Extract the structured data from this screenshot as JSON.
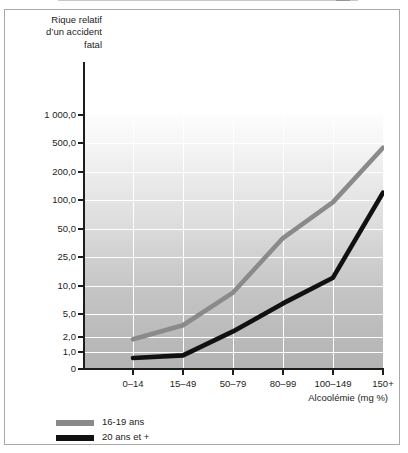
{
  "figure": {
    "background": "#ffffff",
    "border_color": "#a9a9a9"
  },
  "axis_titles": {
    "y_line1": "Rique relatif",
    "y_line2": "d’un accident",
    "y_line3": "fatal",
    "x": "Alcoolémie (mg %)"
  },
  "legend": {
    "items": [
      {
        "label": "16-19 ans",
        "color": "#8a8a8a"
      },
      {
        "label": "20 ans et +",
        "color": "#111111"
      }
    ]
  },
  "chart_data": {
    "type": "line",
    "title": "",
    "subtitle": "",
    "xlabel": "Alcoolémie (mg %)",
    "ylabel": "Rique relatif d’un accident fatal",
    "categories": [
      "0–14",
      "15–49",
      "50–79",
      "80–99",
      "100–149",
      "150+"
    ],
    "y_tick_labels": [
      "1 000,0",
      "500,0",
      "200,0",
      "100,0",
      "50,0",
      "25,0",
      "10,0",
      "5,0",
      "2,0",
      "1,0",
      "0"
    ],
    "y_tick_values": [
      1000,
      500,
      200,
      100,
      50,
      25,
      10,
      5,
      2,
      1,
      0
    ],
    "yscale": "log-like ordinal",
    "grid": true,
    "grid_color": "#ffffff",
    "legend_position": "bottom-left",
    "series": [
      {
        "name": "16-19 ans",
        "color": "#8a8a8a",
        "values": [
          1.8,
          3.2,
          8.5,
          40,
          95,
          430
        ]
      },
      {
        "name": "20 ans et +",
        "color": "#111111",
        "values": [
          0.65,
          0.8,
          2.5,
          6.5,
          13,
          120
        ]
      }
    ]
  }
}
